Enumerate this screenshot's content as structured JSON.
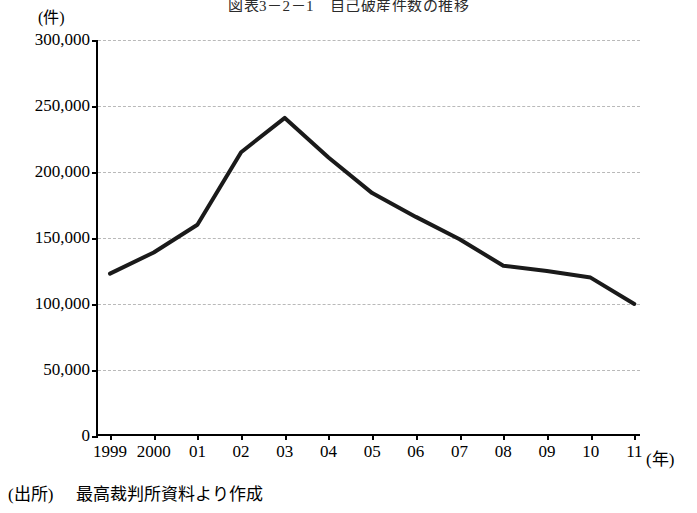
{
  "chart_data": {
    "type": "line",
    "title": "図表3－2－1　自己破産件数の推移",
    "unit_label": "(件)",
    "xlabel": "(年)",
    "ylabel": "",
    "categories": [
      "1999",
      "2000",
      "01",
      "02",
      "03",
      "04",
      "05",
      "06",
      "07",
      "08",
      "09",
      "10",
      "11"
    ],
    "values": [
      123000,
      139000,
      160000,
      215000,
      241000,
      211000,
      184000,
      166000,
      149000,
      129000,
      125000,
      120000,
      100000
    ],
    "ylim": [
      0,
      300000
    ],
    "ytick_labels": [
      "0",
      "50,000",
      "100,000",
      "150,000",
      "200,000",
      "250,000",
      "300,000"
    ],
    "ytick_values": [
      0,
      50000,
      100000,
      150000,
      200000,
      250000,
      300000
    ],
    "grid": true,
    "legend": "none",
    "line_color": "#1a1a1a"
  },
  "source": {
    "label": "(出所)",
    "text": "最高裁判所資料より作成"
  }
}
